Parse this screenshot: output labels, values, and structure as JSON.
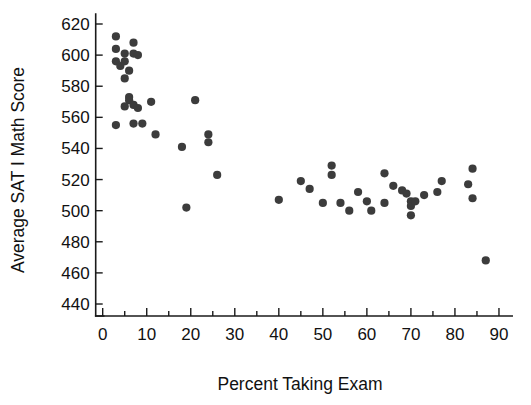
{
  "chart_data": {
    "type": "scatter",
    "title": "",
    "xlabel": "Percent Taking Exam",
    "ylabel": "Average SAT I Math Score",
    "xlim": [
      0,
      93
    ],
    "ylim": [
      440,
      628
    ],
    "xticks": [
      0,
      10,
      20,
      30,
      40,
      50,
      60,
      70,
      80,
      90
    ],
    "yticks": [
      440,
      460,
      480,
      500,
      520,
      540,
      560,
      580,
      600,
      620
    ],
    "grid": false,
    "legend": null,
    "marker_color": "#3c3c3c",
    "axis_color": "#1a1a1a",
    "background_color": "#ffffff",
    "points": [
      [
        3,
        612
      ],
      [
        3,
        604
      ],
      [
        3,
        596
      ],
      [
        4,
        593
      ],
      [
        5,
        601
      ],
      [
        5,
        596
      ],
      [
        6,
        590
      ],
      [
        7,
        608
      ],
      [
        7,
        601
      ],
      [
        8,
        600
      ],
      [
        5,
        585
      ],
      [
        6,
        573
      ],
      [
        6,
        571
      ],
      [
        7,
        568
      ],
      [
        5,
        567
      ],
      [
        8,
        566
      ],
      [
        11,
        570
      ],
      [
        3,
        555
      ],
      [
        7,
        556
      ],
      [
        9,
        556
      ],
      [
        12,
        549
      ],
      [
        18,
        541
      ],
      [
        21,
        571
      ],
      [
        24,
        549
      ],
      [
        24,
        544
      ],
      [
        26,
        523
      ],
      [
        19,
        502
      ],
      [
        40,
        507
      ],
      [
        45,
        519
      ],
      [
        47,
        514
      ],
      [
        52,
        529
      ],
      [
        52,
        523
      ],
      [
        50,
        505
      ],
      [
        54,
        505
      ],
      [
        56,
        500
      ],
      [
        58,
        512
      ],
      [
        60,
        506
      ],
      [
        61,
        500
      ],
      [
        64,
        524
      ],
      [
        64,
        505
      ],
      [
        66,
        516
      ],
      [
        68,
        513
      ],
      [
        69,
        511
      ],
      [
        70,
        506
      ],
      [
        70,
        503
      ],
      [
        70,
        497
      ],
      [
        71,
        506
      ],
      [
        73,
        510
      ],
      [
        76,
        512
      ],
      [
        77,
        519
      ],
      [
        83,
        517
      ],
      [
        84,
        527
      ],
      [
        84,
        508
      ],
      [
        87,
        468
      ]
    ]
  },
  "axes": {
    "x_tick_labels": [
      "0",
      "10",
      "20",
      "30",
      "40",
      "50",
      "60",
      "70",
      "80",
      "90"
    ],
    "y_tick_labels": [
      "440",
      "460",
      "480",
      "500",
      "520",
      "540",
      "560",
      "580",
      "600",
      "620"
    ],
    "x_axis_title": "Percent Taking Exam",
    "y_axis_title": "Average SAT I Math Score"
  }
}
